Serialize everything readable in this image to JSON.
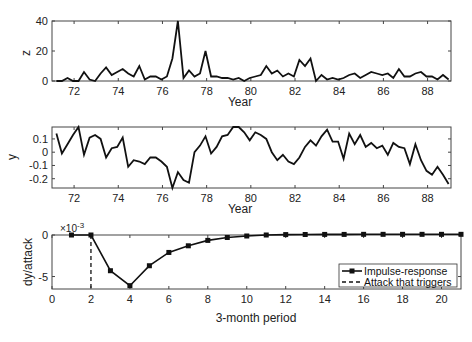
{
  "chart_data": [
    {
      "type": "line",
      "panel": "top",
      "title": "",
      "xlabel": "Year",
      "ylabel": "z",
      "xlim": [
        71.0,
        89.06
      ],
      "ylim": [
        0,
        40
      ],
      "xticks": [
        "72",
        "74",
        "76",
        "78",
        "80",
        "82",
        "84",
        "86",
        "88"
      ],
      "yticks": [
        "0",
        "20",
        "40"
      ],
      "grid": false,
      "x": [
        71.2,
        71.45,
        71.7,
        71.95,
        72.2,
        72.45,
        72.7,
        72.95,
        73.2,
        73.45,
        73.7,
        73.95,
        74.2,
        74.45,
        74.7,
        74.95,
        75.2,
        75.45,
        75.7,
        75.95,
        76.2,
        76.45,
        76.7,
        76.95,
        77.2,
        77.45,
        77.7,
        77.95,
        78.2,
        78.45,
        78.7,
        78.95,
        79.2,
        79.45,
        79.7,
        79.95,
        80.2,
        80.45,
        80.7,
        80.95,
        81.2,
        81.45,
        81.7,
        81.95,
        82.2,
        82.45,
        82.7,
        82.95,
        83.2,
        83.45,
        83.7,
        83.95,
        84.2,
        84.45,
        84.7,
        84.95,
        85.2,
        85.45,
        85.7,
        85.95,
        86.2,
        86.45,
        86.7,
        86.95,
        87.2,
        87.45,
        87.7,
        87.95,
        88.2,
        88.45,
        88.7,
        88.95
      ],
      "series": [
        {
          "name": "z",
          "values": [
            0,
            0,
            2,
            0,
            0,
            6,
            1,
            0,
            5,
            9,
            4,
            6,
            8,
            5,
            3,
            10,
            1,
            3,
            3,
            1,
            3,
            15,
            40,
            2,
            7,
            3,
            5,
            20,
            3,
            3,
            2,
            2,
            1,
            2,
            0,
            2,
            3,
            4,
            10,
            5,
            7,
            3,
            5,
            3,
            14,
            10,
            15,
            0,
            4,
            1,
            2,
            1,
            2,
            4,
            5,
            2,
            4,
            6,
            5,
            4,
            5,
            2,
            8,
            3,
            3,
            5,
            6,
            3,
            3,
            1,
            4,
            1
          ]
        }
      ]
    },
    {
      "type": "line",
      "panel": "middle",
      "title": "",
      "xlabel": "Year",
      "ylabel": "y",
      "xlim": [
        71.0,
        89.06
      ],
      "ylim": [
        -0.27,
        0.19
      ],
      "xticks": [
        "72",
        "74",
        "76",
        "78",
        "80",
        "82",
        "84",
        "86",
        "88"
      ],
      "yticks": [
        "0.1",
        "0",
        "-0.1",
        "-0.2"
      ],
      "grid": false,
      "x": [
        71.2,
        71.45,
        71.7,
        71.95,
        72.2,
        72.45,
        72.7,
        72.95,
        73.2,
        73.45,
        73.7,
        73.95,
        74.2,
        74.45,
        74.7,
        74.95,
        75.2,
        75.45,
        75.7,
        75.95,
        76.2,
        76.45,
        76.7,
        76.95,
        77.2,
        77.45,
        77.7,
        77.95,
        78.2,
        78.45,
        78.7,
        78.95,
        79.2,
        79.45,
        79.7,
        79.95,
        80.2,
        80.45,
        80.7,
        80.95,
        81.2,
        81.45,
        81.7,
        81.95,
        82.2,
        82.45,
        82.7,
        82.95,
        83.2,
        83.45,
        83.7,
        83.95,
        84.2,
        84.45,
        84.7,
        84.95,
        85.2,
        85.45,
        85.7,
        85.95,
        86.2,
        86.45,
        86.7,
        86.95,
        87.2,
        87.45,
        87.7,
        87.95,
        88.2,
        88.45,
        88.7,
        88.95
      ],
      "series": [
        {
          "name": "y",
          "values": [
            0.14,
            -0.01,
            0.06,
            0.13,
            0.19,
            -0.02,
            0.11,
            0.13,
            0.1,
            -0.04,
            0.03,
            0.04,
            0.11,
            -0.11,
            -0.06,
            -0.07,
            -0.09,
            -0.04,
            -0.04,
            -0.07,
            -0.11,
            -0.27,
            -0.15,
            -0.21,
            -0.23,
            0.0,
            0.05,
            0.12,
            -0.01,
            0.04,
            0.12,
            0.13,
            0.19,
            0.19,
            0.15,
            0.09,
            0.15,
            0.13,
            0.1,
            0.0,
            -0.06,
            -0.02,
            -0.07,
            -0.09,
            -0.04,
            0.04,
            0.09,
            0.05,
            0.12,
            0.17,
            0.08,
            0.08,
            -0.05,
            0.14,
            0.06,
            0.13,
            0.04,
            0.07,
            0.03,
            0.05,
            -0.02,
            0.07,
            0.04,
            0.03,
            -0.09,
            0.06,
            -0.06,
            -0.14,
            -0.17,
            -0.11,
            -0.17,
            -0.24
          ]
        }
      ]
    },
    {
      "type": "line",
      "panel": "bottom",
      "title": "",
      "xlabel": "3-month period",
      "ylabel": "dy/attack",
      "y_scale_label": "×10^-3",
      "xlim": [
        0,
        21
      ],
      "ylim": [
        -6.5,
        0
      ],
      "xticks": [
        "0",
        "2",
        "4",
        "6",
        "8",
        "10",
        "12",
        "14",
        "16",
        "18",
        "20"
      ],
      "yticks": [
        "0",
        "-5"
      ],
      "grid": false,
      "legend_position": "lower right",
      "series": [
        {
          "name": "Impulse-response",
          "style": "solid-with-markers",
          "x": [
            1,
            2,
            3,
            4,
            5,
            6,
            7,
            8,
            9,
            10,
            11,
            12,
            13,
            14,
            15,
            16,
            17,
            18,
            19,
            20,
            21
          ],
          "values": [
            0,
            0,
            -4.3,
            -6.1,
            -3.7,
            -2.1,
            -1.3,
            -0.65,
            -0.3,
            -0.12,
            0.0,
            0.05,
            0.06,
            0.07,
            0.07,
            0.08,
            0.08,
            0.08,
            0.08,
            0.08,
            0.08
          ]
        },
        {
          "name": "Attack that triggers",
          "style": "dashed",
          "x": [
            2,
            2
          ],
          "values": [
            0,
            -6.5
          ]
        }
      ]
    }
  ],
  "labels": {
    "top_ylabel": "z",
    "top_xlabel": "Year",
    "mid_ylabel": "y",
    "mid_xlabel": "Year",
    "bot_ylabel": "dy/attack",
    "bot_xlabel": "3-month period",
    "bot_scale_base": "×10",
    "bot_scale_exp": "-3",
    "legend_impulse": "Impulse-response",
    "legend_attack": "Attack that triggers"
  }
}
